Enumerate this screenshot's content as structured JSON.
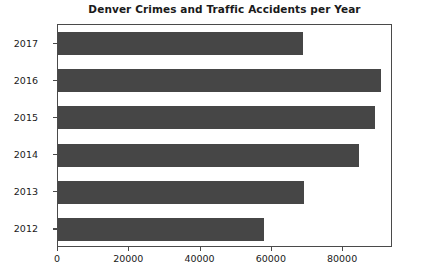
{
  "chart_data": {
    "type": "bar",
    "orientation": "horizontal",
    "title": "Denver Crimes and Traffic Accidents per Year",
    "xlabel": "",
    "ylabel": "",
    "categories": [
      "2012",
      "2013",
      "2014",
      "2015",
      "2016",
      "2017"
    ],
    "values": [
      57700,
      69000,
      84500,
      89000,
      90600,
      68700
    ],
    "series": [
      {
        "name": "Crimes and Traffic Accidents",
        "values": [
          57700,
          69000,
          84500,
          89000,
          90600,
          68700
        ]
      }
    ],
    "display_order_top_to_bottom": [
      "2017",
      "2016",
      "2015",
      "2014",
      "2013",
      "2012"
    ],
    "xlim": [
      0,
      94000
    ],
    "xticks": [
      0,
      20000,
      40000,
      60000,
      80000
    ],
    "xtick_labels": [
      "0",
      "20000",
      "40000",
      "60000",
      "80000"
    ],
    "yticks": [
      "2017",
      "2016",
      "2015",
      "2014",
      "2013",
      "2012"
    ],
    "grid": false,
    "legend": null,
    "bar_color": "#464646",
    "axes_color": "#4a4a4a",
    "background_color": "#ffffff",
    "text_color": "#1a1a1a"
  }
}
